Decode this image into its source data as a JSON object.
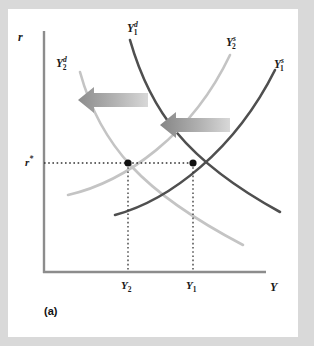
{
  "figure": {
    "panel_label": "(a)",
    "background_color": "#d9d9d9",
    "card_color": "#ffffff"
  },
  "axes": {
    "y_axis_label": "r",
    "x_axis_label": "Y",
    "axis_color": "#808080",
    "origin_px": [
      44,
      272
    ],
    "x_axis_end_px": [
      265,
      272
    ],
    "y_axis_top_px": [
      44,
      30
    ]
  },
  "chart_data": {
    "type": "line",
    "title": "",
    "xlabel": "Y",
    "ylabel": "r",
    "grid": false,
    "legend": "inline-curve-labels",
    "annotations": [
      {
        "name": "demand-shift-arrow",
        "direction": "left",
        "meaning": "demand curve shifts left from Y1d to Y2d",
        "x_start": 148,
        "x_end": 92,
        "y": 100
      },
      {
        "name": "supply-shift-arrow",
        "direction": "left",
        "meaning": "supply curve shifts left from Y1s to Y2s",
        "x_start": 230,
        "x_end": 170,
        "y": 125
      }
    ],
    "equilibria": [
      {
        "name": "new-equilibrium",
        "label": "Y2 at r*",
        "x_px": 128,
        "y_px": 163
      },
      {
        "name": "initial-equilibrium",
        "label": "Y1 at r*",
        "x_px": 193,
        "y_px": 163
      }
    ],
    "series": [
      {
        "name": "Y1d",
        "label_html": "Y<sup>d</sup><sub>1</sub>",
        "kind": "demand",
        "slope": "downward",
        "color": "#4f4f4f",
        "label_x": 128,
        "label_y": 22,
        "path": "M 130 40 C 150 110, 185 160, 280 212"
      },
      {
        "name": "Y2d",
        "label_html": "Y<sup>d</sup><sub>2</sub>",
        "kind": "demand",
        "slope": "downward",
        "color": "#c0c0c0",
        "label_x": 57,
        "label_y": 58,
        "path": "M 80 72 C 100 145, 142 192, 243 245"
      },
      {
        "name": "Y1s",
        "label_html": "Y<sup>s</sup><sub>1</sub>",
        "kind": "supply",
        "slope": "upward",
        "color": "#4f4f4f",
        "label_x": 272,
        "label_y": 57,
        "path": "M 115 215 C 170 200, 235 150, 275 70"
      },
      {
        "name": "Y2s",
        "label_html": "Y<sup>s</sup><sub>2</sub>",
        "kind": "supply",
        "slope": "upward",
        "color": "#c0c0c0",
        "label_x": 227,
        "label_y": 35,
        "path": "M 68 195 C 125 182, 192 135, 230 55"
      }
    ],
    "tick_labels": {
      "y": [
        {
          "name": "r-star",
          "text_html": "r<sup>*</sup>",
          "value_px": 163
        }
      ],
      "x": [
        {
          "name": "Y2",
          "text_html": "Y<sub>2</sub>",
          "value_px": 128
        },
        {
          "name": "Y1",
          "text_html": "Y<sub>1</sub>",
          "value_px": 193
        }
      ]
    },
    "guide_lines": {
      "color": "#333333",
      "style": "dotted",
      "horizontal": {
        "y": 163,
        "x_from": 44,
        "x_to": 193
      },
      "verticals": [
        {
          "x": 128,
          "y_from": 163,
          "y_to": 272
        },
        {
          "x": 193,
          "y_from": 163,
          "y_to": 272
        }
      ]
    }
  }
}
